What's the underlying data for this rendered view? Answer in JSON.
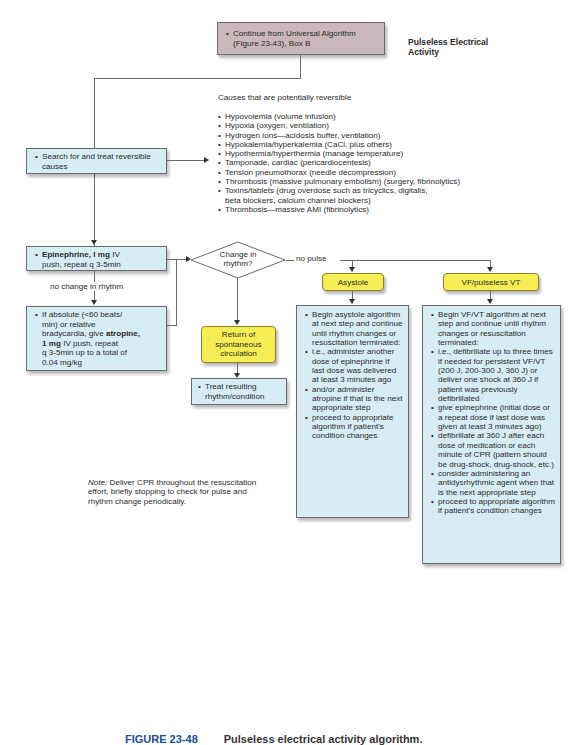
{
  "title": "Pulseless Electrical Activity",
  "start_box": {
    "text": "Continue from Universal Algorithm (Figure 23-43), Box B"
  },
  "search_box": {
    "text": "Search for and treat reversible causes"
  },
  "causes": {
    "heading": "Causes that are potentially reversible",
    "items": [
      "Hypovolemia (volume infusion)",
      "Hypoxia (oxygen, ventilation)",
      "Hydrogen ions—acidosis buffer, ventilation)",
      "Hypokalemia/hyperkalemia (CaCl, plus others)",
      "Hypothermia/hyperthermia (manage temperature)",
      "Tamponade, cardiac (pericardiocentesis)",
      "Tension pneumothorax (needle decompression)",
      "Thrombosis (massive pulmonary embolism) (surgery, fibrinolytics)",
      "Toxins/tablets (drug overdose such as tricyclics, digitalis,",
      "beta blockers, calcium channel blockers)",
      "Thrombosis—massive AMI (fibrinolytics)"
    ]
  },
  "epinephrine_box": {
    "bold": "Epinephrine, I mg",
    "rest1": " IV",
    "rest2": "push, repeat q 3-5min"
  },
  "no_change_label": "no change in rhythm",
  "atropine_box": {
    "line1": "If absolute (<60 beats/",
    "line2": "min) or relative",
    "line3a": "bradycardia, give ",
    "line3b": "atropine,",
    "line4a": "1 mg",
    "line4b": " IV push, repeat",
    "line5": "q 3-5min up to a total of",
    "line6": "0.04 mg/kg"
  },
  "decision": {
    "line1": "Change in",
    "line2": "rhythm?"
  },
  "no_pulse_label": "no pulse",
  "rosc_box": {
    "line1": "Return of",
    "line2": "spontaneous",
    "line3": "circulation"
  },
  "treat_box": {
    "line1": "Treat resulting",
    "line2": "rhythm/condition"
  },
  "asystole": {
    "label": "Asystole",
    "bullets": [
      "Begin asystole algorithm at next step and continue until rhythm changes or resuscitation terminated:",
      "i.e., administer another dose of epinephrine if last dose was delivered at least 3 minutes ago",
      "and/or administer atropine if that is the next appropriate step",
      "proceed to appropriate algorithm if patient's condition changes"
    ]
  },
  "vf": {
    "label": "VF/pulseless VT",
    "bullets": [
      "Begin VF/VT algorithm at next step and continue until rhythm changes or resuscitation terminated:",
      "i.e., defibrillate up to three times if needed for persistent VF/VT (200 J, 200-300 J, 360 J) or deliver one shock at 360 J if patient was previously defibrillated",
      "give epinephrine (initial dose or a repeat dose if last dose was given at least 3 minutes ago)",
      "defibrillate at 360 J after each dose of medication or each minute of CPR (pattern should be drug-shock, drug-shock, etc.)",
      "consider administering an antidysrhythmic agent when that is the next appropriate step",
      "proceed to appropriate algorithm if patient's condition changes"
    ]
  },
  "note": {
    "label": "Note:",
    "text": " Deliver CPR throughout the resuscitation effort, briefly stopping to check for pulse and rhythm change periodically."
  },
  "caption": {
    "figure": "FIGURE 23-48",
    "title": "Pulseless electrical activity algorithm."
  },
  "colors": {
    "blue_box": "#d6edf4",
    "purple_box": "#c9b7bb",
    "yellow_box": "#f7ee55",
    "caption": "#1a4d9a"
  }
}
